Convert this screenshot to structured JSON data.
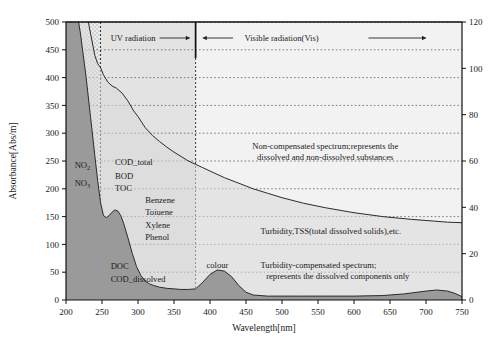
{
  "chart_data": {
    "type": "area",
    "title": "",
    "xlabel": "Wavelength[nm]",
    "ylabel": "Absorbance[Abs/m]",
    "ylabel_right": "",
    "xlim": [
      200,
      750
    ],
    "ylim": [
      0,
      500
    ],
    "ylim_right": [
      0,
      120
    ],
    "xticks": [
      200,
      250,
      300,
      350,
      400,
      450,
      500,
      550,
      600,
      650,
      700,
      750
    ],
    "yticks": [
      0,
      50,
      100,
      150,
      200,
      250,
      300,
      350,
      400,
      450,
      500
    ],
    "yticks_right": [
      0,
      20,
      40,
      60,
      80,
      100,
      120
    ],
    "grid": true,
    "legend_position": "none",
    "series": [
      {
        "name": "Non-compensated spectrum",
        "description": "represents the dissolved and non-dissolved substances",
        "x": [
          200,
          210,
          220,
          228,
          234,
          240,
          244,
          248,
          252,
          258,
          264,
          270,
          278,
          286,
          294,
          300,
          310,
          320,
          330,
          340,
          350,
          360,
          370,
          380,
          390,
          400,
          420,
          440,
          460,
          480,
          500,
          530,
          560,
          600,
          640,
          680,
          710,
          730,
          750
        ],
        "y": [
          640,
          600,
          560,
          520,
          480,
          440,
          425,
          418,
          405,
          392,
          385,
          381,
          372,
          358,
          340,
          330,
          310,
          296,
          285,
          275,
          266,
          258,
          250,
          244,
          238,
          232,
          220,
          210,
          200,
          192,
          184,
          174,
          166,
          157,
          150,
          145,
          142,
          140,
          139
        ]
      },
      {
        "name": "Turbidity-compensated spectrum",
        "description": "represents the dissolved components only",
        "x": [
          200,
          210,
          220,
          228,
          234,
          240,
          244,
          248,
          252,
          256,
          260,
          264,
          268,
          272,
          276,
          280,
          286,
          292,
          298,
          304,
          310,
          316,
          322,
          330,
          340,
          350,
          360,
          370,
          380,
          390,
          400,
          410,
          420,
          430,
          440,
          450,
          460,
          480,
          500,
          530,
          560,
          600,
          640,
          670,
          700,
          715,
          730,
          740,
          750
        ],
        "y": [
          620,
          560,
          480,
          400,
          330,
          260,
          215,
          175,
          152,
          148,
          152,
          158,
          162,
          160,
          152,
          138,
          112,
          84,
          60,
          44,
          34,
          29,
          26,
          23,
          21,
          20,
          19,
          19,
          20,
          32,
          46,
          54,
          52,
          42,
          26,
          14,
          9,
          7,
          7,
          7,
          7,
          7,
          8,
          11,
          16,
          18,
          16,
          12,
          6
        ]
      }
    ],
    "bands": [
      {
        "name": "deep-uv-band",
        "from": 200,
        "to": 248,
        "style": "checkered"
      },
      {
        "name": "uv-band",
        "from": 248,
        "to": 380,
        "style": "light-fill"
      },
      {
        "name": "visible-band",
        "from": 380,
        "to": 750,
        "style": "very-light-fill"
      }
    ],
    "markers": [
      {
        "name": "uv-vis-divider",
        "x": 380,
        "label": ""
      },
      {
        "name": "deep-uv-divider",
        "x": 248,
        "label": ""
      }
    ],
    "annotations": {
      "uv_radiation": "UV radiation",
      "visible_radiation": "Visible radiation(Vis)",
      "non_compensated_line1": "Non-compensated spectrum;represents the",
      "non_compensated_line2": "dissolved and non-dissolved substances",
      "turbidity": "Turbidity,TSS(total dissolved solids),etc.",
      "compensated_line1": "Turbidity-compensated spectrum;",
      "compensated_line2": "represents the dissolved components only",
      "colour": "colour"
    },
    "substance_labels": [
      {
        "name": "no2",
        "text": "NO",
        "sub": "2",
        "x": 212,
        "y": 238
      },
      {
        "name": "no3",
        "text": "NO",
        "sub": "3",
        "x": 212,
        "y": 205
      },
      {
        "name": "cod-total",
        "text": "COD_total",
        "x": 268,
        "y": 243
      },
      {
        "name": "bod",
        "text": "BOD",
        "x": 268,
        "y": 218
      },
      {
        "name": "toc",
        "text": "TOC",
        "x": 268,
        "y": 196
      },
      {
        "name": "benzene",
        "text": "Benzene",
        "x": 310,
        "y": 174
      },
      {
        "name": "toluene",
        "text": "Toiuene",
        "x": 310,
        "y": 152
      },
      {
        "name": "xylene",
        "text": "Xylene",
        "x": 310,
        "y": 130
      },
      {
        "name": "phenol",
        "text": "Phenol",
        "x": 310,
        "y": 108
      },
      {
        "name": "doc",
        "text": "DOC",
        "x": 262,
        "y": 56
      },
      {
        "name": "cod-dissolved",
        "text": "COD_dissolved",
        "x": 262,
        "y": 33
      }
    ]
  }
}
